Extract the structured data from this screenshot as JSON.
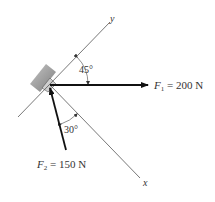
{
  "diagram": {
    "axes": {
      "x_label": "x",
      "y_label": "y"
    },
    "forces": [
      {
        "name": "F",
        "subscript": "1",
        "equals": " = 200 N",
        "magnitude": 200,
        "unit": "N",
        "direction": "horizontal right"
      },
      {
        "name": "F",
        "subscript": "2",
        "equals": " = 150 N",
        "magnitude": 150,
        "unit": "N",
        "direction": "up-left, 30° from x-axis"
      }
    ],
    "angles": [
      {
        "label": "45°",
        "between": "y-axis and F1"
      },
      {
        "label": "30°",
        "between": "F2 and x-axis"
      }
    ],
    "support": "hatched wall block at origin",
    "colors": {
      "line": "#555555",
      "arrow": "#111111",
      "hatch": "#888888"
    }
  }
}
